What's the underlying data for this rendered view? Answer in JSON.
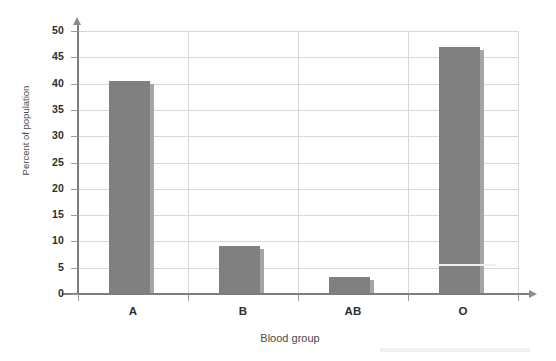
{
  "chart_data": {
    "type": "bar",
    "title": "",
    "subtitle": "",
    "xlabel": "Blood group",
    "ylabel": "Percent of population",
    "categories": [
      "A",
      "B",
      "AB",
      "O"
    ],
    "values": [
      40.5,
      9.2,
      3.3,
      47.0
    ],
    "series": [
      {
        "name": "Percent of population",
        "values": [
          40.5,
          9.2,
          3.3,
          47.0
        ]
      }
    ],
    "ylim": [
      0,
      50
    ],
    "ytick_labels": [
      "0",
      "5",
      "10",
      "15",
      "20",
      "25",
      "30",
      "35",
      "40",
      "45",
      "50"
    ],
    "ytick_values": [
      0,
      5,
      10,
      15,
      20,
      25,
      30,
      35,
      40,
      45,
      50
    ],
    "grid": "both",
    "legend": "none",
    "bar_color": "#808080",
    "bar_edge_color": "#a5a5a5",
    "gridline_color": "#d8d8d8",
    "axis_color": "#7d7d7d",
    "background": "#ffffff"
  }
}
